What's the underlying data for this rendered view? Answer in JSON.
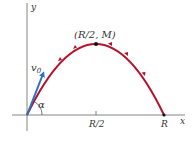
{
  "diagram": {
    "type": "projectile-trajectory",
    "axes": {
      "x_label": "x",
      "y_label": "y"
    },
    "labels": {
      "peak": "(R/2, M)",
      "half_range": "R/2",
      "range": "R",
      "angle": "α",
      "velocity": "v",
      "velocity_sub": "0"
    },
    "colors": {
      "trajectory": "#b5122a",
      "velocity_arrow": "#2a6fc9",
      "axes": "#555555",
      "point": "#111111"
    }
  }
}
